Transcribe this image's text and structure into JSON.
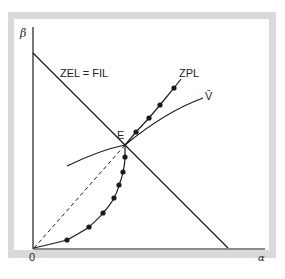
{
  "diagram": {
    "y_axis_label": "β",
    "x_axis_label": "α",
    "origin_label": "0",
    "curves": {
      "zel_fil": {
        "label": "ZEL = FIL",
        "style": "solid straight line"
      },
      "zpl": {
        "label": "ZPL",
        "style": "solid curve with dots"
      },
      "v_bar": {
        "label": "V̄",
        "style": "solid curve"
      },
      "ray": {
        "label": "",
        "style": "dashed line from origin to E"
      }
    },
    "intersection_label": "E"
  },
  "colors": {
    "frame": "#d9d9d9",
    "line": "#1a1a1a",
    "background": "#ffffff"
  }
}
